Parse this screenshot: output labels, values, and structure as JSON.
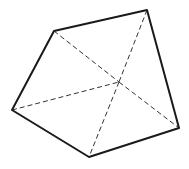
{
  "diagram": {
    "type": "geometric-solid",
    "vertices": {
      "A": [
        54,
        31
      ],
      "B": [
        147,
        10
      ],
      "C": [
        179,
        128
      ],
      "D": [
        89,
        157
      ],
      "E": [
        12,
        110
      ],
      "O": [
        119,
        82
      ]
    },
    "solid_edges": [
      [
        "A",
        "B"
      ],
      [
        "B",
        "C"
      ],
      [
        "C",
        "D"
      ],
      [
        "D",
        "E"
      ],
      [
        "E",
        "A"
      ]
    ],
    "dashed_edges": [
      [
        "A",
        "O"
      ],
      [
        "O",
        "C"
      ],
      [
        "B",
        "O"
      ],
      [
        "O",
        "D"
      ],
      [
        "E",
        "O"
      ]
    ],
    "colors": {
      "solid": "#1a1a1a",
      "dashed": "#333333",
      "background": "#ffffff"
    }
  }
}
